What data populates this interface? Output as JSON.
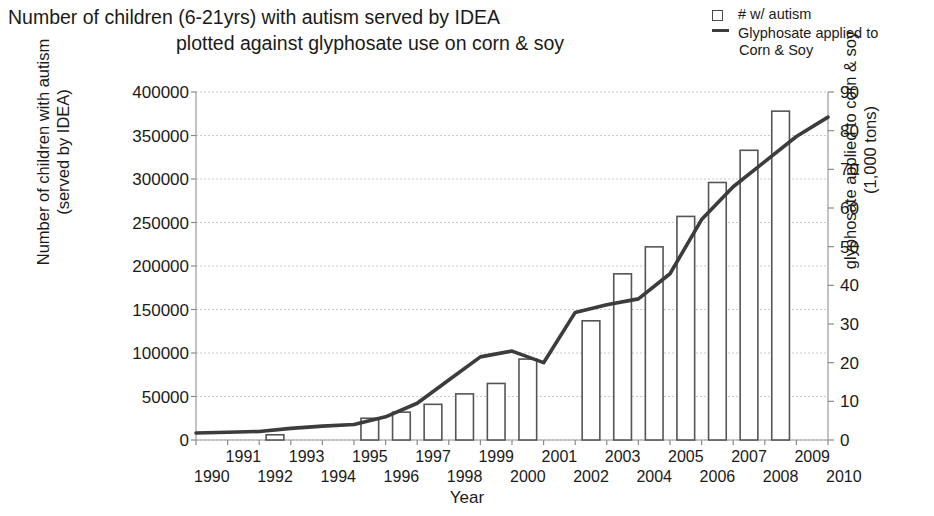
{
  "title": {
    "line1": "Number of children (6-21yrs) with autism served by IDEA",
    "line2": "plotted against glyphosate use on corn & soy"
  },
  "legend": {
    "items": [
      {
        "label": "# w/ autism",
        "label_line2": "",
        "marker": "open-square",
        "color": "#4a4a4a"
      },
      {
        "label": "Glyphosate applied to",
        "label_line2": "Corn & Soy",
        "marker": "line",
        "color": "#3c3c3c"
      }
    ]
  },
  "axes": {
    "left_title_line1": "Number of children with autism",
    "left_title_line2": "(served by IDEA)",
    "right_title_line1": "glyphosate applied to corn & soy",
    "right_title_line2": "(1,000 tons)",
    "x_title": "Year"
  },
  "chart_data": {
    "type": "bar",
    "title": "Number of children (6-21yrs) with autism served by IDEA plotted against glyphosate use on corn & soy",
    "xlabel": "Year",
    "ylabel": "Number of children with autism (served by IDEA)",
    "y2label": "glyphosate applied to corn & soy (1,000 tons)",
    "grid": true,
    "legend_position": "top-right",
    "categories": [
      1990,
      1991,
      1992,
      1993,
      1994,
      1995,
      1996,
      1997,
      1998,
      1999,
      2000,
      2001,
      2002,
      2003,
      2004,
      2005,
      2006,
      2007,
      2008,
      2009,
      2010
    ],
    "xlim": [
      1990,
      2010
    ],
    "ylim": [
      0,
      400000
    ],
    "y2lim": [
      0,
      90
    ],
    "ytick_labels": [
      "0",
      "50000",
      "100000",
      "150000",
      "200000",
      "250000",
      "300000",
      "350000",
      "400000"
    ],
    "ytick_values": [
      0,
      50000,
      100000,
      150000,
      200000,
      250000,
      300000,
      350000,
      400000
    ],
    "y2tick_labels": [
      "0",
      "10",
      "20",
      "30",
      "40",
      "50",
      "60",
      "70",
      "80",
      "90"
    ],
    "y2tick_values": [
      0,
      10,
      20,
      30,
      40,
      50,
      60,
      70,
      80,
      90
    ],
    "xtick_labels_top": [
      "1991",
      "1993",
      "1995",
      "1997",
      "1999",
      "2001",
      "2003",
      "2005",
      "2007",
      "2009"
    ],
    "xtick_labels_bottom": [
      "1990",
      "1992",
      "1994",
      "1996",
      "1998",
      "2000",
      "2002",
      "2004",
      "2006",
      "2008",
      "2010"
    ],
    "series": [
      {
        "name": "# w/ autism",
        "type": "bar",
        "axis": "left",
        "color": "#ffffff",
        "edge_color": "#555555",
        "points": [
          {
            "x": 1992,
            "y": 6000
          },
          {
            "x": 1995,
            "y": 25000
          },
          {
            "x": 1996,
            "y": 32000
          },
          {
            "x": 1997,
            "y": 41000
          },
          {
            "x": 1998,
            "y": 53000
          },
          {
            "x": 1999,
            "y": 65000
          },
          {
            "x": 2000,
            "y": 93000
          },
          {
            "x": 2002,
            "y": 137000
          },
          {
            "x": 2003,
            "y": 191000
          },
          {
            "x": 2004,
            "y": 222000
          },
          {
            "x": 2005,
            "y": 257000
          },
          {
            "x": 2006,
            "y": 296000
          },
          {
            "x": 2007,
            "y": 333000
          },
          {
            "x": 2008,
            "y": 378000
          }
        ]
      },
      {
        "name": "Glyphosate applied to Corn & Soy",
        "type": "line",
        "axis": "right",
        "color": "#3c3c3c",
        "points": [
          {
            "x": 1990,
            "y": 1.8
          },
          {
            "x": 1991,
            "y": 2.0
          },
          {
            "x": 1992,
            "y": 2.2
          },
          {
            "x": 1993,
            "y": 3.0
          },
          {
            "x": 1994,
            "y": 3.6
          },
          {
            "x": 1995,
            "y": 4.0
          },
          {
            "x": 1996,
            "y": 6.0
          },
          {
            "x": 1997,
            "y": 9.5
          },
          {
            "x": 1998,
            "y": 15.5
          },
          {
            "x": 1999,
            "y": 21.5
          },
          {
            "x": 2000,
            "y": 23.0
          },
          {
            "x": 2001,
            "y": 20.0
          },
          {
            "x": 2002,
            "y": 33.0
          },
          {
            "x": 2003,
            "y": 35.0
          },
          {
            "x": 2004,
            "y": 36.5
          },
          {
            "x": 2005,
            "y": 43.0
          },
          {
            "x": 2006,
            "y": 57.0
          },
          {
            "x": 2007,
            "y": 65.5
          },
          {
            "x": 2008,
            "y": 72.0
          },
          {
            "x": 2009,
            "y": 78.5
          },
          {
            "x": 2010,
            "y": 83.5
          }
        ]
      }
    ]
  }
}
